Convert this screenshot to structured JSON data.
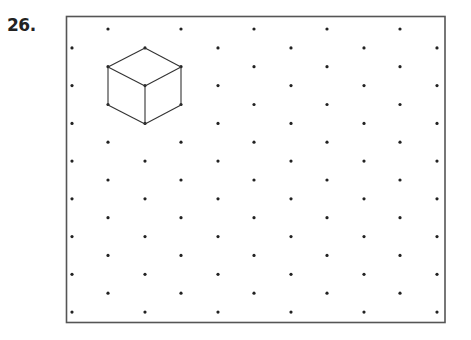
{
  "problem": {
    "number_label": "26."
  },
  "frame": {
    "x": 66.5,
    "y": 16.5,
    "width": 378.5,
    "height": 306,
    "stroke": "#555555",
    "stroke_width": 1.6
  },
  "dot_grid": {
    "type": "isometric",
    "rows": 16,
    "row_start_y": 29,
    "row_step": 18.87,
    "even_row_x": [
      108,
      181,
      254,
      327,
      400
    ],
    "odd_row_x": [
      72,
      145,
      218,
      291,
      364,
      437
    ],
    "dot_radius": 1.6,
    "color": "#222222"
  },
  "cube": {
    "stroke": "#333333",
    "stroke_width": 1.1,
    "vertices": {
      "top": [
        145,
        48
      ],
      "upper_left": [
        108,
        67
      ],
      "upper_right": [
        181,
        67
      ],
      "center": [
        145,
        86
      ],
      "lower_left": [
        108,
        105
      ],
      "lower_right": [
        181,
        105
      ],
      "bottom": [
        145,
        124
      ]
    },
    "edges": [
      [
        "top",
        "upper_left"
      ],
      [
        "top",
        "upper_right"
      ],
      [
        "upper_left",
        "center"
      ],
      [
        "upper_right",
        "center"
      ],
      [
        "upper_left",
        "lower_left"
      ],
      [
        "upper_right",
        "lower_right"
      ],
      [
        "center",
        "bottom"
      ],
      [
        "lower_left",
        "bottom"
      ],
      [
        "lower_right",
        "bottom"
      ]
    ]
  }
}
